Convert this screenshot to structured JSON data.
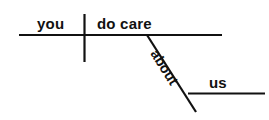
{
  "diagram": {
    "type": "reed-kellogg-sentence-diagram",
    "sentence": "you do care about us",
    "ink_color": "#111111",
    "background_color": "#ffffff",
    "words": {
      "subject": "you",
      "verb": "do care",
      "preposition": "about",
      "object_of_preposition": "us"
    },
    "lines": {
      "baseline": "horizontal baseline",
      "subject_verb_divider": "vertical divider",
      "prepositional_slant": "diagonal slant line",
      "object_line": "horizontal object line"
    }
  }
}
